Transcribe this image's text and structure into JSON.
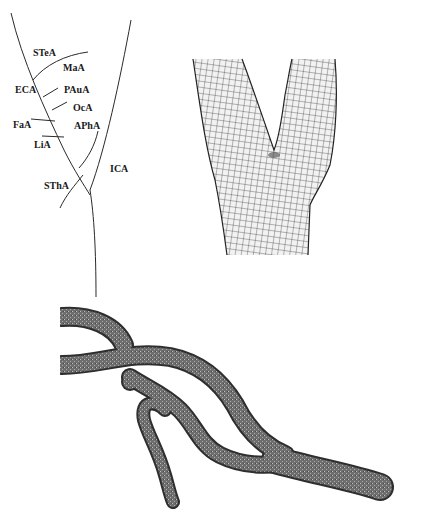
{
  "figure": {
    "panels": [
      {
        "id": "schematic",
        "description": "Schematic of carotid artery branches"
      },
      {
        "id": "mesh",
        "description": "Quadrilateral surface mesh of carotid bifurcation"
      },
      {
        "id": "vessel3d",
        "description": "3D reconstructed vessel surface mesh"
      }
    ]
  },
  "schematic": {
    "labels": {
      "stea": "STeA",
      "maa": "MaA",
      "eca": "ECA",
      "paua": "PAuA",
      "oca": "OcA",
      "faa": "FaA",
      "apha": "APhA",
      "lia": "LiA",
      "ica": "ICA",
      "stha": "SThA"
    }
  },
  "colors": {
    "line": "#2a2a2a",
    "mesh_fill": "#e8e8e8",
    "mesh_line": "#333333",
    "vessel_fill": "#7a7a7a",
    "vessel_edge": "#3a3a3a",
    "background": "#ffffff"
  }
}
